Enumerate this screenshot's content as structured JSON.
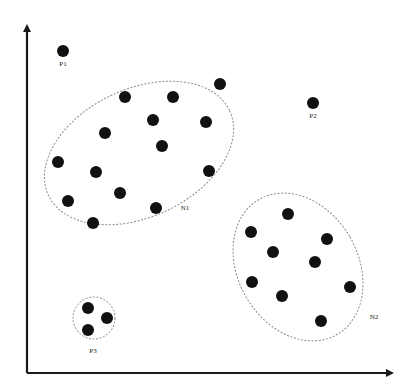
{
  "diagram": {
    "type": "cluster-scatter",
    "axes": {
      "x_axis": {
        "from": [
          27,
          373
        ],
        "to": [
          392,
          373
        ],
        "label": ""
      },
      "y_axis": {
        "from": [
          27,
          373
        ],
        "to": [
          27,
          26
        ],
        "label": ""
      }
    },
    "colors": {
      "point": "#111111",
      "boundary": "#8a8a8a",
      "axis": "#1a1a1a"
    },
    "point_radius": 6,
    "clusters": [
      {
        "id": "N1",
        "label": "N1",
        "label_pos": [
          185,
          210
        ],
        "ellipse": {
          "cx": 139,
          "cy": 153,
          "rx": 100,
          "ry": 64,
          "rotate": -25
        },
        "points": [
          [
            220,
            84
          ],
          [
            125,
            97
          ],
          [
            173,
            97
          ],
          [
            153,
            120
          ],
          [
            206,
            122
          ],
          [
            105,
            133
          ],
          [
            162,
            146
          ],
          [
            58,
            162
          ],
          [
            96,
            172
          ],
          [
            209,
            171
          ],
          [
            120,
            193
          ],
          [
            68,
            201
          ],
          [
            156,
            208
          ],
          [
            93,
            223
          ]
        ]
      },
      {
        "id": "N2",
        "label": "N2",
        "label_pos": [
          374,
          319
        ],
        "ellipse": {
          "cx": 298,
          "cy": 267,
          "rx": 60,
          "ry": 78,
          "rotate": -30
        },
        "points": [
          [
            288,
            214
          ],
          [
            251,
            232
          ],
          [
            327,
            239
          ],
          [
            273,
            252
          ],
          [
            315,
            262
          ],
          [
            252,
            282
          ],
          [
            350,
            287
          ],
          [
            282,
            296
          ],
          [
            321,
            321
          ]
        ]
      },
      {
        "id": "P3",
        "label": "P3",
        "label_pos": [
          93,
          353
        ],
        "ellipse": {
          "cx": 94,
          "cy": 318,
          "rx": 21,
          "ry": 21,
          "rotate": 0
        },
        "points": [
          [
            88,
            308
          ],
          [
            107,
            318
          ],
          [
            88,
            330
          ]
        ]
      }
    ],
    "outliers": [
      {
        "id": "P1",
        "label": "P1",
        "point": [
          63,
          51
        ],
        "label_pos": [
          63,
          66
        ]
      },
      {
        "id": "P2",
        "label": "P2",
        "point": [
          313,
          103
        ],
        "label_pos": [
          313,
          118
        ]
      }
    ]
  }
}
